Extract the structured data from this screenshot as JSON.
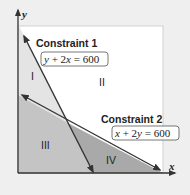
{
  "axes": {
    "x_label": "x",
    "y_label": "y"
  },
  "constraints": [
    {
      "label": "Constraint 1",
      "equation": "y + 2x = 600",
      "eq_parts": [
        "y",
        " + 2",
        "x",
        " = 600"
      ]
    },
    {
      "label": "Constraint 2",
      "equation": "x + 2y = 600",
      "eq_parts": [
        "x",
        " + 2",
        "y",
        " = 600"
      ]
    }
  ],
  "regions": [
    {
      "label": "I",
      "fill": "#e4e4e4"
    },
    {
      "label": "II",
      "fill": "#ffffff"
    },
    {
      "label": "III",
      "fill": "#c4c4c4"
    },
    {
      "label": "IV",
      "fill": "#a9a9a9"
    }
  ],
  "colors": {
    "background": "#efefef",
    "plot_area": "#ffffff",
    "line": "#333333"
  }
}
